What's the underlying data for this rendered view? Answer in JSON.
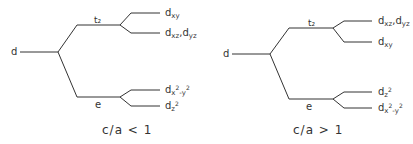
{
  "diagrams": [
    {
      "id": "left",
      "root_label": "d",
      "upper_group": "t2",
      "lower_group": "e",
      "upper_levels": [
        "dxy",
        "dxz, dyz"
      ],
      "lower_levels": [
        "dx²-y²",
        "dz²"
      ],
      "caption": "c/a < 1",
      "caption_parts": {
        "ratio": "c/a",
        "relation": "<",
        "value": "1"
      }
    },
    {
      "id": "right",
      "root_label": "d",
      "upper_group": "t2",
      "lower_group": "e",
      "upper_levels": [
        "dxz, dyz",
        "dxy"
      ],
      "lower_levels": [
        "dz²",
        "dx²-y²"
      ],
      "caption": "c/a > 1",
      "caption_parts": {
        "ratio": "c/a",
        "relation": ">",
        "value": "1"
      }
    }
  ],
  "text": {
    "d": "d",
    "t2": "t₂",
    "e": "e",
    "left_caption": "c/a  <  1",
    "right_caption": "c/a  >  1",
    "dxy_d": "d",
    "dxy_sub": "xy",
    "dxz_d": "d",
    "dxz_sub": "xz",
    "dyz_d": "d",
    "dyz_sub": "yz",
    "comma": ",",
    "dz2_d": "d",
    "dz2_sub": "z",
    "dz2_sup": "2",
    "dx2y2_d": "d",
    "dx2y2_sub1": "x",
    "dx2y2_sup1": "2",
    "dx2y2_sub2": "-y",
    "dx2y2_sup2": "2"
  },
  "colors": {
    "line": "#333333",
    "background": "#ffffff"
  }
}
